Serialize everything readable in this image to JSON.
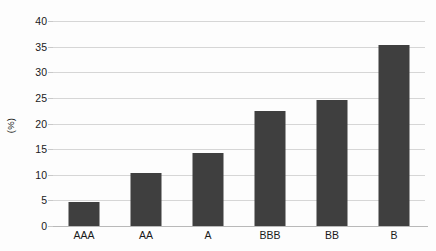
{
  "chart_data": {
    "type": "bar",
    "title": "",
    "xlabel": "",
    "ylabel": "(%)",
    "categories": [
      "AAA",
      "AA",
      "A",
      "BBB",
      "BB",
      "B"
    ],
    "values": [
      4.6,
      10.3,
      14.2,
      22.4,
      24.6,
      35.3
    ],
    "ylim": [
      0,
      40
    ],
    "yticks": [
      0,
      5,
      10,
      15,
      20,
      25,
      30,
      35,
      40
    ],
    "ytick_labels": [
      "0",
      "5",
      "10",
      "15",
      "20",
      "25",
      "30",
      "35",
      "40"
    ],
    "grid": true,
    "legend": false,
    "series": [
      {
        "name": "",
        "values": [
          4.6,
          10.3,
          14.2,
          22.4,
          24.6,
          35.3
        ]
      }
    ]
  },
  "style": {
    "bar_color": "#3f3f3f",
    "grid_color": "#d6d6d6",
    "axis_color": "#b9b9b9",
    "text_color": "#1a1a1a",
    "background": "#fdfdfd"
  }
}
